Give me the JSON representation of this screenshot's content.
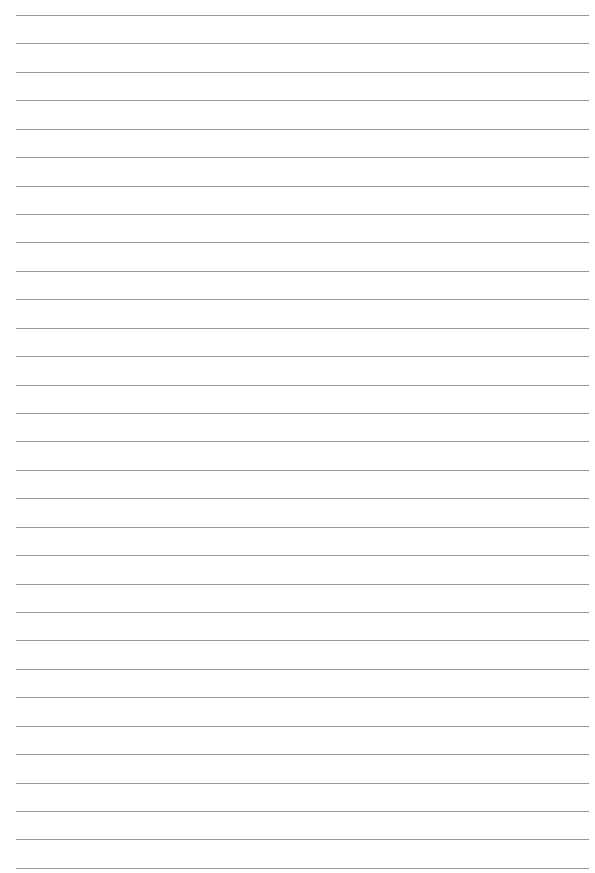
{
  "page": {
    "type": "lined-paper",
    "background_color": "#ffffff",
    "rule_color": "#8c8c8c",
    "rule_count": 31,
    "first_rule_y": 15,
    "rule_spacing": 28.43,
    "rule_left": 16,
    "rule_right": 589
  }
}
